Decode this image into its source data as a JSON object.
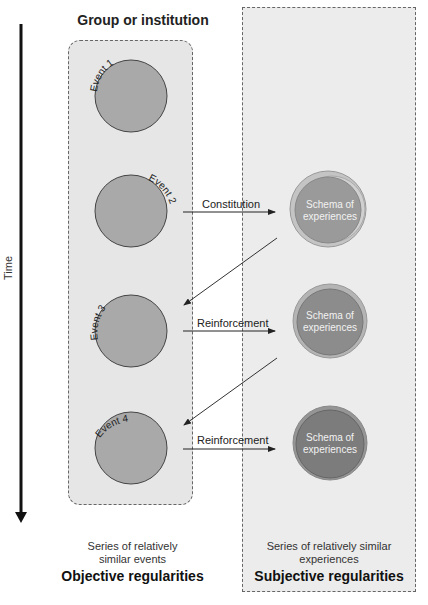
{
  "title": "Group or institution",
  "axis": {
    "label": "Time"
  },
  "events": [
    {
      "label": "Event 1"
    },
    {
      "label": "Event 2"
    },
    {
      "label": "Event 3"
    },
    {
      "label": "Event 4"
    }
  ],
  "schemas": [
    {
      "line1": "Schema of",
      "line2": "experiences",
      "fill": "#9a9a9a"
    },
    {
      "line1": "Schema of",
      "line2": "experiences",
      "fill": "#8c8c8c"
    },
    {
      "line1": "Schema of",
      "line2": "experiences",
      "fill": "#7c7c7c"
    }
  ],
  "arrows": [
    {
      "label": "Constitution"
    },
    {
      "label": "Reinforcement"
    },
    {
      "label": "Reinforcement"
    }
  ],
  "captions": {
    "left": {
      "line1": "Series of relatively",
      "line2": "similar events",
      "title": "Objective regularities"
    },
    "right": {
      "line1": "Series of relatively similar",
      "line2": "experiences",
      "title": "Subjective regularities"
    }
  },
  "colors": {
    "event_fill": "#a9a9a9",
    "left_bg": "#e6e6e6",
    "right_bg": "#ececec"
  }
}
